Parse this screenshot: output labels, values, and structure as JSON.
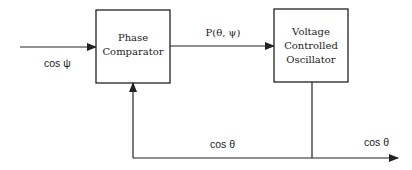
{
  "diagram": {
    "blocks": {
      "phase_comparator": {
        "lines": [
          "Phase",
          "Comparator"
        ]
      },
      "vco": {
        "lines": [
          "Voltage",
          "Controlled",
          "Oscillator"
        ]
      }
    },
    "signals": {
      "input": "cos ψ",
      "comparator_output": "P(θ, ψ)",
      "feedback": "cos θ",
      "output": "cos θ"
    }
  }
}
